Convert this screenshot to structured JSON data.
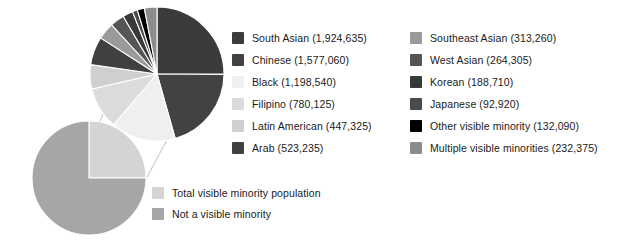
{
  "chart_data": {
    "type": "pie",
    "title": "",
    "subtitle": "",
    "xlabel": "",
    "ylabel": "",
    "legend_position": "right",
    "overview": {
      "type": "pie",
      "categories": [
        "Total visible minority population",
        "Not a visible minority"
      ],
      "values": [
        25,
        75
      ],
      "colors": [
        "#d4d4d4",
        "#a6a6a6"
      ]
    },
    "detail": {
      "type": "pie",
      "categories": [
        "South Asian",
        "Chinese",
        "Black",
        "Filipino",
        "Latin American",
        "Arab",
        "Southeast Asian",
        "West Asian",
        "Korean",
        "Japanese",
        "Other visible minority",
        "Multiple visible minorities"
      ],
      "values": [
        1924635,
        1577060,
        1198540,
        780125,
        447325,
        523235,
        313260,
        264305,
        188710,
        92920,
        132090,
        232375
      ],
      "colors": [
        "#3b3b3b",
        "#424242",
        "#efefef",
        "#dcdcdc",
        "#cfcfcf",
        "#404040",
        "#9a9a9a",
        "#555555",
        "#383838",
        "#4a4a4a",
        "#000000",
        "#8c8c8c"
      ],
      "total": 7674590
    }
  },
  "legend_primary": {
    "items": [
      {
        "label": "South Asian (1,924,635)",
        "color": "#3b3b3b",
        "name": "south-asian"
      },
      {
        "label": "Chinese (1,577,060)",
        "color": "#424242",
        "name": "chinese"
      },
      {
        "label": "Black (1,198,540)",
        "color": "#efefef",
        "name": "black"
      },
      {
        "label": "Filipino (780,125)",
        "color": "#dcdcdc",
        "name": "filipino"
      },
      {
        "label": "Latin American (447,325)",
        "color": "#cfcfcf",
        "name": "latin-american"
      },
      {
        "label": "Arab (523,235)",
        "color": "#404040",
        "name": "arab"
      }
    ]
  },
  "legend_secondary": {
    "items": [
      {
        "label": "Southeast Asian (313,260)",
        "color": "#9a9a9a",
        "name": "southeast-asian"
      },
      {
        "label": "West Asian (264,305)",
        "color": "#555555",
        "name": "west-asian"
      },
      {
        "label": "Korean (188,710)",
        "color": "#383838",
        "name": "korean"
      },
      {
        "label": "Japanese (92,920)",
        "color": "#4a4a4a",
        "name": "japanese"
      },
      {
        "label": "Other visible minority (132,090)",
        "color": "#000000",
        "name": "other-visible-minority"
      },
      {
        "label": "Multiple visible minorities (232,375)",
        "color": "#8c8c8c",
        "name": "multiple-visible-minorities"
      }
    ]
  },
  "legend_overview": {
    "items": [
      {
        "label": "Total visible minority population",
        "color": "#d4d4d4",
        "name": "total-visible-minority-population"
      },
      {
        "label": "Not a visible minority",
        "color": "#a6a6a6",
        "name": "not-a-visible-minority"
      }
    ]
  }
}
